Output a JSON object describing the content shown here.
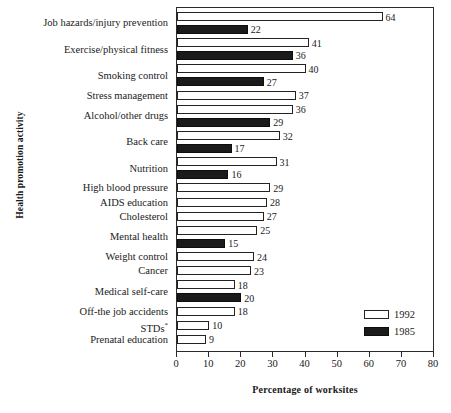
{
  "chart_data": {
    "type": "bar",
    "orientation": "horizontal",
    "title": "",
    "xlabel": "Percentage of worksites",
    "ylabel": "Health promotion activity",
    "xlim": [
      0,
      80
    ],
    "xticks": [
      0,
      10,
      20,
      30,
      40,
      50,
      60,
      70,
      80
    ],
    "grid": false,
    "legend_position": "inside-bottom-right",
    "footnote_marker": "*",
    "categories": [
      "Job hazards/injury prevention",
      "Exercise/physical fitness",
      "Smoking control",
      "Stress management",
      "Alcohol/other drugs",
      "Back care",
      "Nutrition",
      "High blood pressure",
      "AIDS education",
      "Cholesterol",
      "Mental health",
      "Weight control",
      "Cancer",
      "Medical self-care",
      "Off-the job accidents",
      "STDs",
      "Prenatal education"
    ],
    "series": [
      {
        "name": "1992",
        "color": "#ffffff",
        "values": [
          64,
          41,
          40,
          37,
          36,
          32,
          31,
          29,
          28,
          27,
          25,
          24,
          23,
          18,
          18,
          10,
          9
        ]
      },
      {
        "name": "1985",
        "color": "#1b1b1b",
        "values": [
          22,
          36,
          27,
          null,
          29,
          17,
          16,
          null,
          null,
          null,
          15,
          null,
          null,
          20,
          null,
          null,
          null
        ]
      }
    ]
  },
  "legend": {
    "entries": [
      {
        "label": "1992",
        "swatch": "white-bar-swatch"
      },
      {
        "label": "1985",
        "swatch": "black-bar-swatch"
      }
    ]
  },
  "axes": {
    "x_title": "Percentage of worksites",
    "y_title": "Health promotion activity",
    "x_tick_labels": [
      "0",
      "10",
      "20",
      "30",
      "40",
      "50",
      "60",
      "70",
      "80"
    ]
  }
}
